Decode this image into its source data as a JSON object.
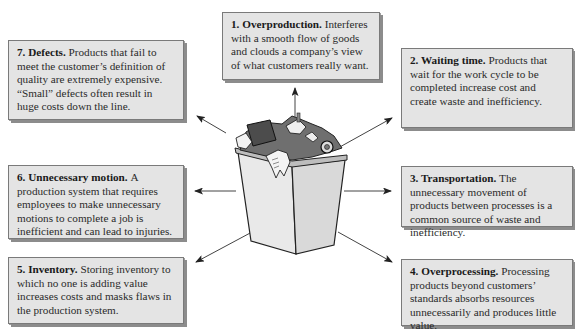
{
  "center_graphic": "trash-can-overflowing-icon",
  "colors": {
    "box_face": "#e4e4e4",
    "box_border": "#7a7a7a",
    "box_shadow": "#8c8c8c",
    "arrow": "#333333"
  },
  "wastes": [
    {
      "id": 1,
      "heading": "1. Overproduction.",
      "text": "Interferes with a smooth flow of goods and clouds a company’s view of what customers really want."
    },
    {
      "id": 2,
      "heading": "2. Waiting time.",
      "text": "Products that wait for the work cycle to be completed increase cost and create waste and inefficiency."
    },
    {
      "id": 3,
      "heading": "3. Transportation.",
      "text": "The unnecessary movement of products between processes is a common source of waste and inefficiency."
    },
    {
      "id": 4,
      "heading": "4. Overprocessing.",
      "text": "Processing products beyond customers’ standards absorbs resources unnecessarily and produces little value."
    },
    {
      "id": 5,
      "heading": "5. Inventory.",
      "text": "Storing inventory to which no one is adding value increases costs and masks flaws in the production system."
    },
    {
      "id": 6,
      "heading": "6. Unnecessary motion.",
      "text": "A production system that requires employees to make unnecessary motions to complete a job is inefficient and can lead to injuries."
    },
    {
      "id": 7,
      "heading": "7. Defects.",
      "text": "Products that fail to meet the customer’s definition of quality are extremely expensive. “Small” defects often result in huge costs down the line."
    }
  ]
}
